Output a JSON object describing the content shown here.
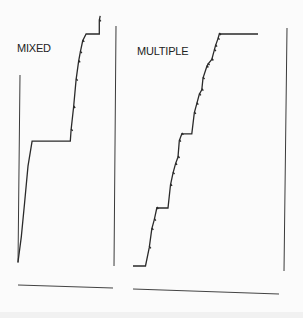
{
  "chart_data": [
    {
      "type": "line",
      "style": "step",
      "title": "MIXED",
      "xlabel": "",
      "ylabel": "",
      "xlim": [
        0,
        100
      ],
      "ylim": [
        0,
        100
      ],
      "grid": false,
      "legend": "none",
      "series": [
        {
          "name": "MIXED",
          "points": [
            [
              0,
              0
            ],
            [
              4,
              11
            ],
            [
              8,
              26
            ],
            [
              12,
              42
            ],
            [
              17,
              53
            ],
            [
              18,
              53
            ],
            [
              63,
              53
            ],
            [
              64,
              58
            ],
            [
              67,
              68
            ],
            [
              70,
              80
            ],
            [
              73,
              88
            ],
            [
              75,
              92
            ],
            [
              78,
              97
            ],
            [
              82,
              100
            ],
            [
              98,
              100
            ],
            [
              98,
              106
            ],
            [
              99,
              108
            ]
          ]
        }
      ]
    },
    {
      "type": "line",
      "style": "step",
      "title": "MULTIPLE",
      "xlabel": "",
      "ylabel": "",
      "xlim": [
        0,
        100
      ],
      "ylim": [
        0,
        100
      ],
      "grid": false,
      "legend": "none",
      "series": [
        {
          "name": "MULTIPLE",
          "points": [
            [
              0,
              0
            ],
            [
              10,
              0
            ],
            [
              13,
              8
            ],
            [
              15,
              16
            ],
            [
              17,
              20
            ],
            [
              19,
              25
            ],
            [
              28,
              25
            ],
            [
              30,
              35
            ],
            [
              32,
              40
            ],
            [
              34,
              44
            ],
            [
              36,
              47
            ],
            [
              37,
              54
            ],
            [
              39,
              57
            ],
            [
              47,
              57
            ],
            [
              49,
              66
            ],
            [
              51,
              70
            ],
            [
              53,
              74
            ],
            [
              55,
              76
            ],
            [
              56,
              81
            ],
            [
              59,
              86
            ],
            [
              60,
              87
            ],
            [
              63,
              89
            ],
            [
              65,
              93
            ],
            [
              66,
              95
            ],
            [
              68,
              98
            ],
            [
              69,
              100
            ],
            [
              100,
              100
            ]
          ]
        }
      ]
    }
  ]
}
